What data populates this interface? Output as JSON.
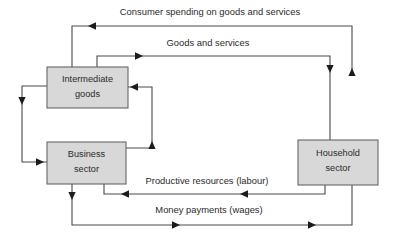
{
  "diagram": {
    "type": "flow-diagram",
    "canvas": {
      "width": 394,
      "height": 242,
      "background": "#ffffff"
    },
    "style": {
      "box_fill": "#d8d8d8",
      "box_stroke": "#666666",
      "line_stroke": "#4a4a4a",
      "arrow_fill": "#1c1c1c",
      "text_color": "#2b2b2b"
    },
    "nodes": [
      {
        "id": "intermediate-goods",
        "line1": "Intermediate",
        "line2": "goods",
        "x": 47,
        "y": 67,
        "w": 81,
        "h": 41
      },
      {
        "id": "business-sector",
        "line1": "Business",
        "line2": "sector",
        "x": 47,
        "y": 142,
        "w": 79,
        "h": 42
      },
      {
        "id": "household-sector",
        "line1": "Household",
        "line2": "sector",
        "x": 298,
        "y": 140,
        "w": 80,
        "h": 45
      }
    ],
    "edges": [
      {
        "id": "consumer-spending",
        "label": "Consumer spending on goods and services",
        "label_x": 210,
        "label_y": 13,
        "from": "household-sector",
        "to": "intermediate-goods"
      },
      {
        "id": "goods-and-services",
        "label": "Goods and services",
        "label_x": 208,
        "label_y": 44,
        "from": "intermediate-goods",
        "to": "household-sector"
      },
      {
        "id": "productive-resources",
        "label": "Productive resources (labour)",
        "label_x": 207,
        "label_y": 182,
        "from": "household-sector",
        "to": "business-sector"
      },
      {
        "id": "money-payments",
        "label": "Money payments (wages)",
        "label_x": 209,
        "label_y": 211,
        "from": "business-sector",
        "to": "household-sector"
      },
      {
        "id": "intermediate-to-business",
        "label": "",
        "from": "intermediate-goods",
        "to": "business-sector"
      },
      {
        "id": "business-to-intermediate",
        "label": "",
        "from": "business-sector",
        "to": "intermediate-goods"
      }
    ]
  }
}
